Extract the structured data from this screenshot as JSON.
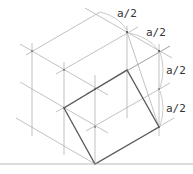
{
  "diagram": {
    "labels": [
      {
        "text": "a/2",
        "x": 117,
        "y": 17
      },
      {
        "text": "a/2",
        "x": 146,
        "y": 36
      },
      {
        "text": "a/2",
        "x": 166,
        "y": 74
      },
      {
        "text": "a/2",
        "x": 166,
        "y": 112
      }
    ],
    "colors": {
      "grid": "#9a9a9a",
      "square": "#555555",
      "base": "#a0a0a0",
      "arc": "#b0b0b0"
    }
  }
}
